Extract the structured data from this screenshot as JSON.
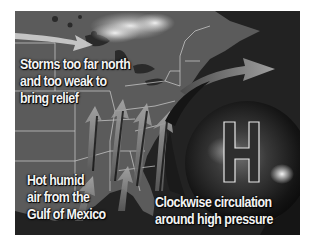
{
  "figure": {
    "labels": {
      "storms": [
        "Storms too far north",
        "and too weak to",
        "bring relief"
      ],
      "humid_air": [
        "Hot humid",
        "air from the",
        "Gulf of Mexico"
      ],
      "circulation": [
        "Clockwise circulation",
        "around high pressure"
      ],
      "high_pressure_symbol": "H"
    },
    "colors": {
      "background": "#ffffff",
      "map_land": "#5a5a5a",
      "water": "#1e1e1e",
      "borders": "#d8d8d8",
      "text": "#f4f4f4",
      "arrows": "#9a9a9a"
    }
  }
}
